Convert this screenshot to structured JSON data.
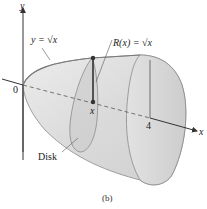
{
  "figure": {
    "caption": "(b)",
    "labels": {
      "y_axis": "y",
      "x_axis": "x",
      "origin": "0",
      "curve": "y = √x",
      "radius": "R(x) = √x",
      "x_point": "x",
      "x_end": "4",
      "disk": "Disk"
    },
    "colors": {
      "solid_fill": "#dcdcdc",
      "solid_dark": "#c4c4c4",
      "outline": "#8a8a8a",
      "axis": "#333333",
      "radius_line": "#333333"
    }
  }
}
